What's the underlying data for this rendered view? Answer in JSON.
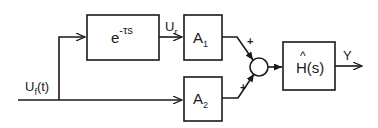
{
  "diagram": {
    "input": {
      "symbol": "U",
      "subscript": "f",
      "arg": "(t)"
    },
    "delay_block": {
      "base": "e",
      "exponent": "-τs"
    },
    "delay_output": {
      "symbol": "U",
      "subscript": "r"
    },
    "gain_1": {
      "symbol": "A",
      "subscript": "1"
    },
    "gain_2": {
      "symbol": "A",
      "subscript": "2"
    },
    "summer": {
      "sign_top": "+",
      "sign_bottom": "+"
    },
    "filter_block": {
      "hat": "^",
      "label": "H(s)"
    },
    "output": {
      "symbol": "Y"
    }
  }
}
